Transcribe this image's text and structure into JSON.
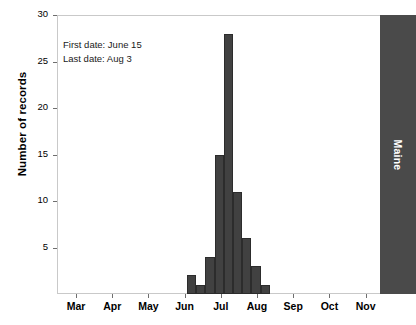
{
  "chart_data": {
    "type": "bar",
    "title": "",
    "subtitle": "",
    "xlabel": "",
    "ylabel": "Number of records",
    "ylim": [
      0,
      30
    ],
    "yticks": [
      5,
      10,
      15,
      20,
      25,
      30
    ],
    "ytick_labels": [
      "5",
      "10",
      "15",
      "20",
      "25",
      "30"
    ],
    "xtick_labels": [
      "Mar",
      "Apr",
      "May",
      "Jun",
      "Jul",
      "Aug",
      "Sep",
      "Oct",
      "Nov"
    ],
    "categories": [
      "Jun wk3",
      "Jun wk4",
      "Jul wk1",
      "Jul wk2",
      "Jul wk3",
      "Jul wk4",
      "Aug wk1",
      "Aug wk2",
      "Aug wk3"
    ],
    "values": [
      2,
      1,
      4,
      15,
      28,
      11,
      6,
      3,
      1
    ],
    "grid": false,
    "legend": null,
    "bar_color": "#414141",
    "highlight_bar": {
      "label": "Maine",
      "value": 30,
      "color": "#4a4a4a"
    },
    "annotations": [
      "First date: June 15",
      "Last date: Aug 3"
    ]
  },
  "annotation": {
    "first_date": "First date: June 15",
    "last_date": "Last date: Aug 3"
  },
  "axes": {
    "y_label": "Number of records"
  }
}
